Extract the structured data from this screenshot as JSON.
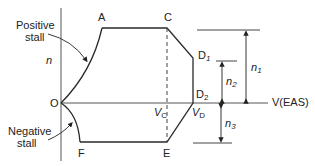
{
  "diagram": {
    "axis_y_label": "n",
    "axis_x_label": "V(EAS)",
    "points": {
      "O": "O",
      "A": "A",
      "C": "C",
      "D1": "D",
      "D1_sub": "1",
      "D2": "D",
      "D2_sub": "2",
      "E": "E",
      "F": "F"
    },
    "velocity_labels": {
      "vc": "V",
      "vc_sub": "C",
      "vd": "V",
      "vd_sub": "D"
    },
    "annotations": {
      "positive_stall_line1": "Positive",
      "positive_stall_line2": "stall",
      "negative_stall_line1": "Negative",
      "negative_stall_line2": "stall"
    },
    "load_factors": {
      "n1": "n",
      "n1_sub": "1",
      "n2": "n",
      "n2_sub": "2",
      "n3": "n",
      "n3_sub": "3"
    },
    "colors": {
      "line": "#2a2a2a",
      "axis": "#555555"
    }
  }
}
